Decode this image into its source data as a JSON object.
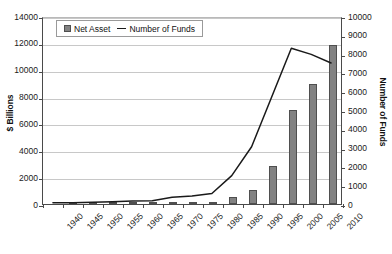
{
  "chart_data": {
    "type": "bar",
    "title": "",
    "subtitle": "",
    "xlabel": "",
    "ylabel": "$ Billions",
    "y2label": "Number of Funds",
    "grid": true,
    "legend_position": "top-left-inside",
    "categories": [
      "1940",
      "1945",
      "1950",
      "1955",
      "1960",
      "1965",
      "1970",
      "1975",
      "1980",
      "1985",
      "1990",
      "1995",
      "2000",
      "2005",
      "2010"
    ],
    "ylim": [
      0,
      14000
    ],
    "y_ticks": [
      0,
      2000,
      4000,
      6000,
      8000,
      10000,
      12000,
      14000
    ],
    "y2lim": [
      0,
      10000
    ],
    "y2_ticks": [
      0,
      1000,
      2000,
      3000,
      4000,
      5000,
      6000,
      7000,
      8000,
      9000,
      10000
    ],
    "series": [
      {
        "name": "Net Asset",
        "type": "bar",
        "axis": "left",
        "unit": "$ Billions",
        "color": "#828282",
        "values": [
          0,
          1,
          3,
          8,
          17,
          35,
          48,
          46,
          135,
          495,
          1065,
          2810,
          6965,
          8905,
          11820
        ]
      },
      {
        "name": "Number of Funds",
        "type": "line",
        "axis": "right",
        "unit": "funds",
        "color": "#1a1a1a",
        "values": [
          68,
          73,
          98,
          125,
          161,
          170,
          361,
          426,
          564,
          1528,
          3079,
          5725,
          8370,
          8044,
          7581
        ]
      }
    ]
  },
  "legend": {
    "items": [
      {
        "label": "Net Asset",
        "marker": "square-swatch"
      },
      {
        "label": "Number of Funds",
        "marker": "line-swatch"
      }
    ]
  },
  "axes": {
    "left": {
      "title": "$ Billions",
      "tick_labels": [
        "14000",
        "12000",
        "10000",
        "8000",
        "6000",
        "4000",
        "2000",
        "0"
      ]
    },
    "right": {
      "title": "Number of Funds",
      "tick_labels": [
        "10000",
        "9000",
        "8000",
        "7000",
        "6000",
        "5000",
        "4000",
        "3000",
        "2000",
        "1000",
        "0"
      ]
    },
    "bottom": {
      "tick_labels": [
        "1940",
        "1945",
        "1950",
        "1955",
        "1960",
        "1965",
        "1970",
        "1975",
        "1980",
        "1985",
        "1990",
        "1995",
        "2000",
        "2005",
        "2010"
      ]
    }
  }
}
